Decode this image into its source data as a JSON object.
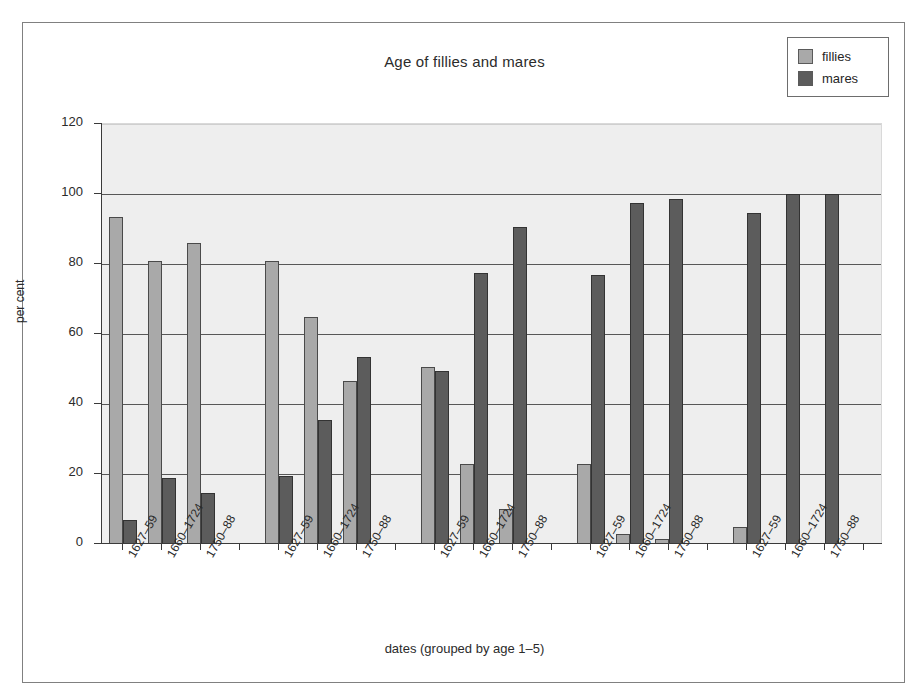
{
  "chart_data": {
    "type": "bar",
    "title": "Age of fillies and mares",
    "xlabel": "dates (grouped by age 1–5)",
    "ylabel": "per cent",
    "ylim": [
      0,
      120
    ],
    "yticks": [
      0,
      20,
      40,
      60,
      80,
      100,
      120
    ],
    "grid": true,
    "legend_position": "top-right",
    "categories": [
      "1627–59",
      "1660–1724",
      "1750–88",
      "1627–59",
      "1660–1724",
      "1750–88",
      "1627–59",
      "1660–1724",
      "1750–88",
      "1627–59",
      "1660–1724",
      "1750–88",
      "1627–59",
      "1660–1724",
      "1750–88"
    ],
    "groups": [
      {
        "name": "age 1",
        "categories": [
          "1627–59",
          "1660–1724",
          "1750–88"
        ]
      },
      {
        "name": "age 2",
        "categories": [
          "1627–59",
          "1660–1724",
          "1750–88"
        ]
      },
      {
        "name": "age 3",
        "categories": [
          "1627–59",
          "1660–1724",
          "1750–88"
        ]
      },
      {
        "name": "age 4",
        "categories": [
          "1627–59",
          "1660–1724",
          "1750–88"
        ]
      },
      {
        "name": "age 5",
        "categories": [
          "1627–59",
          "1660–1724",
          "1750–88"
        ]
      }
    ],
    "series": [
      {
        "name": "fillies",
        "color": "#a9a9a9",
        "values": [
          93.5,
          81,
          86,
          81,
          65,
          46.5,
          50.5,
          23,
          10,
          23,
          3,
          1.5,
          5,
          0,
          0
        ]
      },
      {
        "name": "mares",
        "color": "#5c5c5c",
        "values": [
          7,
          19,
          14.5,
          19.5,
          35.5,
          53.5,
          49.5,
          77.5,
          90.5,
          77,
          97.5,
          98.5,
          94.5,
          100,
          100
        ]
      }
    ]
  },
  "legend": {
    "items": [
      {
        "label": "fillies",
        "color": "#a9a9a9"
      },
      {
        "label": "mares",
        "color": "#5c5c5c"
      }
    ]
  }
}
